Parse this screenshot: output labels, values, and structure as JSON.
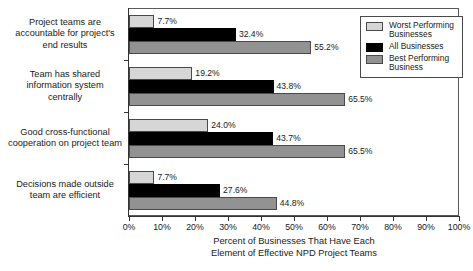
{
  "chart_data": {
    "type": "bar",
    "orientation": "horizontal",
    "title": "",
    "xlabel": "Percent of Businesses That Have Each Element of Effective NPD Project Teams",
    "xlabel_lines": [
      "Percent of Businesses That Have Each",
      "Element of Effective NPD Project Teams"
    ],
    "ylabel": "",
    "xlim": [
      0,
      100
    ],
    "xticks": [
      0,
      10,
      20,
      30,
      40,
      50,
      60,
      70,
      80,
      90,
      100
    ],
    "xtick_labels": [
      "0%",
      "10%",
      "20%",
      "30%",
      "40%",
      "50%",
      "60%",
      "70%",
      "80%",
      "90%",
      "100%"
    ],
    "grid": false,
    "legend_position": "top-right",
    "categories": [
      "Project teams are accountable for project's end results",
      "Team has shared information system centrally",
      "Good cross-functional cooperation on project team",
      "Decisions made outside team are efficient"
    ],
    "category_lines": [
      [
        "Project teams are",
        "accountable for project's",
        "end results"
      ],
      [
        "Team has shared",
        "information system",
        "centrally"
      ],
      [
        "Good cross-functional",
        "cooperation on project team"
      ],
      [
        "Decisions made outside",
        "team are efficient"
      ]
    ],
    "series": [
      {
        "name": "Worst Performing Businesses",
        "color": "#d6d6d6",
        "values": [
          7.7,
          19.2,
          24.0,
          7.7
        ],
        "labels": [
          "7.7%",
          "19.2%",
          "24.0%",
          "7.7%"
        ]
      },
      {
        "name": "All Businesses",
        "color": "#000000",
        "values": [
          32.4,
          43.8,
          43.7,
          27.6
        ],
        "labels": [
          "32.4%",
          "43.8%",
          "43.7%",
          "27.6%"
        ]
      },
      {
        "name": "Best Performing Business",
        "color": "#929292",
        "values": [
          55.2,
          65.5,
          65.5,
          44.8
        ],
        "labels": [
          "55.2%",
          "65.5%",
          "65.5%",
          "44.8%"
        ]
      }
    ]
  },
  "legend": {
    "entries": [
      {
        "label_lines": [
          "Worst Performing",
          "Businesses"
        ],
        "label": "Worst Performing Businesses"
      },
      {
        "label_lines": [
          "All Businesses"
        ],
        "label": "All Businesses"
      },
      {
        "label_lines": [
          "Best Performing",
          "Business"
        ],
        "label": "Best Performing Business"
      }
    ]
  }
}
